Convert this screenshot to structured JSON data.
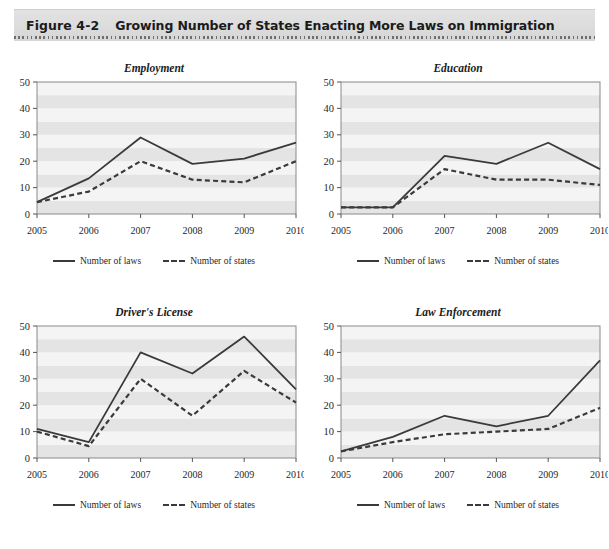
{
  "header": {
    "figure_number": "Figure 4-2",
    "title": "Growing Number of States Enacting More Laws on Immigration",
    "band_color": "#dcdcdc"
  },
  "legend": {
    "laws_label": "Number of laws",
    "states_label": "Number of states",
    "line_color": "#3a3a3a"
  },
  "axis": {
    "y_ticks": [
      0,
      10,
      20,
      30,
      40,
      50
    ],
    "x_ticks": [
      "2005",
      "2006",
      "2007",
      "2008",
      "2009",
      "2010"
    ],
    "ylim": [
      0,
      50
    ]
  },
  "chart_data": [
    {
      "type": "line",
      "title": "Employment",
      "xlabel": "",
      "ylabel": "",
      "ylim": [
        0,
        50
      ],
      "grid": "horizontal-bands",
      "legend_position": "bottom",
      "categories": [
        "2005",
        "2006",
        "2007",
        "2008",
        "2009",
        "2010"
      ],
      "series": [
        {
          "name": "Number of laws",
          "style": "solid",
          "values": [
            4.5,
            13.5,
            29,
            19,
            21,
            27
          ]
        },
        {
          "name": "Number of states",
          "style": "dashed",
          "values": [
            4.5,
            8.5,
            20,
            13,
            12,
            20
          ]
        }
      ]
    },
    {
      "type": "line",
      "title": "Education",
      "xlabel": "",
      "ylabel": "",
      "ylim": [
        0,
        50
      ],
      "grid": "horizontal-bands",
      "legend_position": "bottom",
      "categories": [
        "2005",
        "2006",
        "2007",
        "2008",
        "2009",
        "2010"
      ],
      "series": [
        {
          "name": "Number of laws",
          "style": "solid",
          "values": [
            2.5,
            2.5,
            22,
            19,
            27,
            17
          ]
        },
        {
          "name": "Number of states",
          "style": "dashed",
          "values": [
            2.5,
            2.5,
            17,
            13,
            13,
            11
          ]
        }
      ]
    },
    {
      "type": "line",
      "title": "Driver's License",
      "xlabel": "",
      "ylabel": "",
      "ylim": [
        0,
        50
      ],
      "grid": "horizontal-bands",
      "legend_position": "bottom",
      "categories": [
        "2005",
        "2006",
        "2007",
        "2008",
        "2009",
        "2010"
      ],
      "series": [
        {
          "name": "Number of laws",
          "style": "solid",
          "values": [
            11,
            6,
            40,
            32,
            46,
            26
          ]
        },
        {
          "name": "Number of states",
          "style": "dashed",
          "values": [
            10,
            4.5,
            30,
            16,
            33,
            21
          ]
        }
      ]
    },
    {
      "type": "line",
      "title": "Law Enforcement",
      "xlabel": "",
      "ylabel": "",
      "ylim": [
        0,
        50
      ],
      "grid": "horizontal-bands",
      "legend_position": "bottom",
      "categories": [
        "2005",
        "2006",
        "2007",
        "2008",
        "2009",
        "2010"
      ],
      "series": [
        {
          "name": "Number of laws",
          "style": "solid",
          "values": [
            2.5,
            8,
            16,
            12,
            16,
            37
          ]
        },
        {
          "name": "Number of states",
          "style": "dashed",
          "values": [
            2.5,
            6,
            9,
            10,
            11,
            19
          ]
        }
      ]
    }
  ]
}
